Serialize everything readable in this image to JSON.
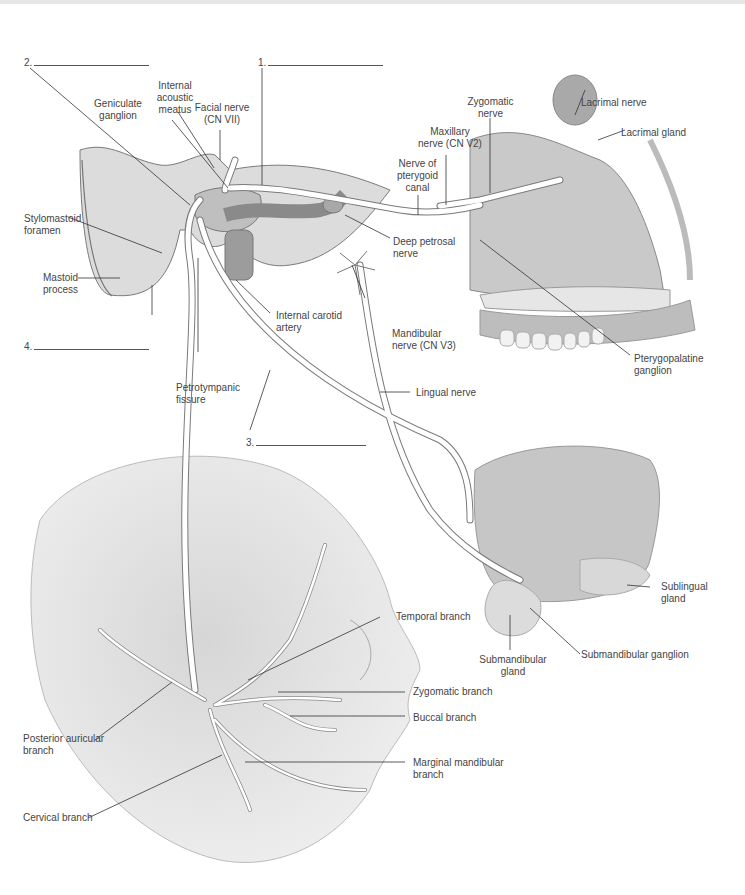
{
  "figure": {
    "blanks": [
      {
        "number": "1.",
        "answer": ""
      },
      {
        "number": "2.",
        "answer": ""
      },
      {
        "number": "3.",
        "answer": ""
      },
      {
        "number": "4.",
        "answer": ""
      }
    ],
    "labels": {
      "internal_acoustic_meatus": "Internal\nacoustic\nmeatus",
      "geniculate_ganglion": "Geniculate\nganglion",
      "facial_nerve": "Facial nerve\n(CN VII)",
      "zygomatic_nerve": "Zygomatic\nnerve",
      "lacrimal_nerve": "Lacrimal nerve",
      "lacrimal_gland": "Lacrimal gland",
      "maxillary_nerve": "Maxillary\nnerve (CN V2)",
      "nerve_pterygoid_canal": "Nerve of\npterygoid\ncanal",
      "deep_petrosal_nerve": "Deep petrosal\nnerve",
      "stylomastoid_foramen": "Stylomastoid\nforamen",
      "mastoid_process": "Mastoid\nprocess",
      "internal_carotid_artery": "Internal carotid\nartery",
      "mandibular_nerve": "Mandibular\nnerve (CN V3)",
      "pterygopalatine_ganglion": "Pterygopalatine\nganglion",
      "petrotympanic_fissure": "Petrotympanic\nfissure",
      "lingual_nerve": "Lingual nerve",
      "sublingual_gland": "Sublingual\ngland",
      "temporal_branch": "Temporal branch",
      "submandibular_gland": "Submandibular\ngland",
      "submandibular_ganglion": "Submandibular ganglion",
      "zygomatic_branch": "Zygomatic branch",
      "buccal_branch": "Buccal branch",
      "posterior_auricular_branch": "Posterior auricular\nbranch",
      "marginal_mandibular_branch": "Marginal mandibular\nbranch",
      "cervical_branch": "Cervical branch"
    },
    "colors": {
      "bone": "#d9d9d9",
      "tissue": "#c8c8c8",
      "nerve": "#ffffff",
      "outline": "#6e6e6e",
      "leader": "#333333"
    }
  }
}
